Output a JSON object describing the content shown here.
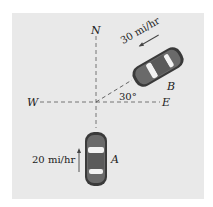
{
  "diagram": {
    "compass": {
      "north": "N",
      "west": "W",
      "east": "E"
    },
    "angle_label": "30°",
    "car_a": {
      "label": "A",
      "speed": "20 mi/hr",
      "heading": "north"
    },
    "car_b": {
      "label": "B",
      "speed": "30 mi/hr",
      "heading": "toward origin, 30° above east axis"
    },
    "colors": {
      "background": "#e9e9e9",
      "car_body": "#555555",
      "axis": "#555555"
    }
  }
}
